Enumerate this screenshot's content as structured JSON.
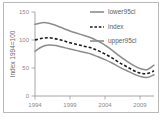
{
  "chart_data": {
    "type": "line",
    "title": "",
    "xlabel": "",
    "ylabel": "Index 1994=100",
    "xlim": [
      1994,
      2011
    ],
    "ylim": [
      0,
      150
    ],
    "grid": false,
    "legend_position": "top-right",
    "x_ticks": [
      "1994",
      "1999",
      "2004",
      "2009"
    ],
    "x_tick_values": [
      1994,
      1999,
      2004,
      2009
    ],
    "y_ticks": [
      "0",
      "50",
      "100",
      "150"
    ],
    "y_tick_values": [
      0,
      50,
      100,
      150
    ],
    "x": [
      1994,
      1995,
      1996,
      1997,
      1998,
      1999,
      2000,
      2001,
      2002,
      2003,
      2004,
      2005,
      2006,
      2007,
      2008,
      2009,
      2010,
      2011
    ],
    "series": [
      {
        "name": "lower95cl",
        "style": "solid",
        "color": "#8c8c8c",
        "values": [
          128,
          131,
          130,
          126,
          121,
          116,
          112,
          108,
          104,
          98,
          91,
          82,
          72,
          63,
          55,
          49,
          47,
          55
        ]
      },
      {
        "name": "index",
        "style": "dashed",
        "color": "#1b1b1b",
        "values": [
          100,
          103,
          104,
          102,
          99,
          95,
          92,
          89,
          86,
          81,
          75,
          68,
          60,
          53,
          46,
          41,
          40,
          45
        ]
      },
      {
        "name": "upper95cl",
        "style": "solid",
        "color": "#8c8c8c",
        "values": [
          80,
          88,
          91,
          90,
          87,
          84,
          81,
          78,
          75,
          70,
          65,
          59,
          52,
          46,
          40,
          35,
          33,
          38
        ]
      }
    ],
    "legend": [
      {
        "label": "lower95cl",
        "marker": "solid-line",
        "color": "#8c8c8c"
      },
      {
        "label": "index",
        "marker": "dashed-line",
        "color": "#1b1b1b"
      },
      {
        "label": "upper95cl",
        "marker": "solid-line",
        "color": "#8c8c8c"
      }
    ]
  },
  "figure": {
    "caption_fragment": ""
  }
}
